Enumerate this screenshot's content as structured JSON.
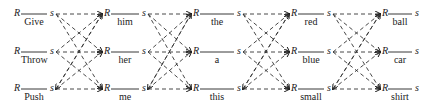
{
  "diagram": {
    "type": "word-lattice",
    "node_start_label": "R",
    "node_end_label": "s",
    "columns": [
      {
        "words": [
          "Give",
          "Throw",
          "Push"
        ]
      },
      {
        "words": [
          "him",
          "her",
          "me"
        ]
      },
      {
        "words": [
          "the",
          "a",
          "this"
        ]
      },
      {
        "words": [
          "red",
          "blue",
          "small"
        ]
      },
      {
        "words": [
          "ball",
          "car",
          "shirt"
        ]
      }
    ],
    "edges": "fully connected dashed arrows from each s of column i to each R of column i+1"
  }
}
